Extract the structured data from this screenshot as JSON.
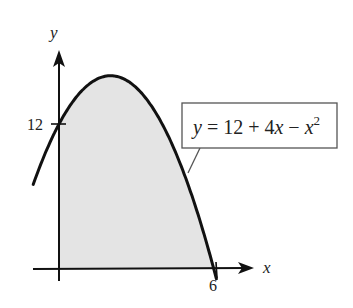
{
  "chart_data": {
    "type": "area",
    "title": "",
    "equation_label": "y = 12 + 4x − x²",
    "equation_parts": {
      "lhs": "y",
      "eq": " = 12 + 4",
      "x": "x",
      "minus": " − ",
      "x2": "x",
      "exp": "2"
    },
    "xlabel": "x",
    "ylabel": "y",
    "x_ticks": [
      {
        "value": 6,
        "label": "6"
      }
    ],
    "y_ticks": [
      {
        "value": 12,
        "label": "12"
      }
    ],
    "function": "12 + 4x - x^2",
    "curve_domain": [
      -1,
      6.1
    ],
    "shaded_region": {
      "from_x": 0,
      "to_x": 6,
      "description": "area under curve above x-axis"
    },
    "points": [
      {
        "x": -1,
        "y": 7
      },
      {
        "x": 0,
        "y": 12
      },
      {
        "x": 1,
        "y": 15
      },
      {
        "x": 2,
        "y": 16
      },
      {
        "x": 3,
        "y": 15
      },
      {
        "x": 4,
        "y": 12
      },
      {
        "x": 5,
        "y": 7
      },
      {
        "x": 6,
        "y": 0
      }
    ],
    "xlim": [
      -1,
      7.5
    ],
    "ylim": [
      0,
      18
    ],
    "grid": false,
    "colors": {
      "fill": "#e4e4e4",
      "stroke": "#111111",
      "box": "#555555"
    }
  }
}
